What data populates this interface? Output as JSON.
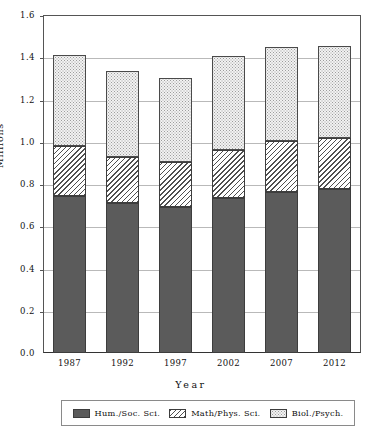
{
  "chart_data": {
    "type": "bar",
    "subtype": "stacked-vertical",
    "title": "",
    "xlabel": "Year",
    "ylabel": "Millions",
    "categories": [
      "1987",
      "1992",
      "1997",
      "2002",
      "2007",
      "2012"
    ],
    "series": [
      {
        "name": "Hum./Soc. Sci.",
        "fill": "solid-dark",
        "color": "#5b5b5b",
        "values": [
          0.745,
          0.71,
          0.69,
          0.735,
          0.76,
          0.775
        ]
      },
      {
        "name": "Math/Phys. Sci.",
        "fill": "diagonal-hatch",
        "color": "#4f4f4f",
        "values": [
          0.235,
          0.22,
          0.215,
          0.225,
          0.245,
          0.245
        ]
      },
      {
        "name": "Biol./Psych.",
        "fill": "light-dotted",
        "color": "#f2f2f2",
        "values": [
          0.43,
          0.405,
          0.395,
          0.445,
          0.445,
          0.435
        ]
      }
    ],
    "totals": [
      1.41,
      1.335,
      1.3,
      1.405,
      1.45,
      1.455
    ],
    "ylim": [
      0.0,
      1.6
    ],
    "ytick_labels": [
      "0.0",
      "0.2",
      "0.4",
      "0.6",
      "0.8",
      "1.0",
      "1.2",
      "1.4",
      "1.6"
    ],
    "ytick_values": [
      0.0,
      0.2,
      0.4,
      0.6,
      0.8,
      1.0,
      1.2,
      1.4,
      1.6
    ],
    "grid": true,
    "legend_position": "bottom"
  },
  "axes": {
    "y_title": "Millions",
    "x_title": "Year"
  },
  "legend": {
    "entries": [
      {
        "label": "Hum./Soc. Sci."
      },
      {
        "label": "Math/Phys. Sci."
      },
      {
        "label": "Biol./Psych."
      }
    ]
  }
}
